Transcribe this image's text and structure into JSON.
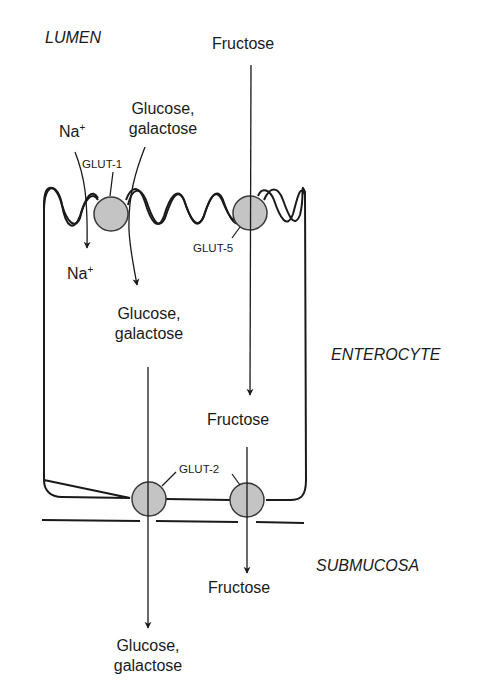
{
  "regions": {
    "lumen": "LUMEN",
    "enterocyte": "ENTEROCYTE",
    "submucosa": "SUBMUCOSA"
  },
  "substrates": {
    "fructose_lumen": "Fructose",
    "fructose_cell": "Fructose",
    "fructose_submucosa": "Fructose",
    "na_lumen": "Na",
    "na_cell": "Na",
    "na_charge": "+",
    "glucose_lumen_line1": "Glucose,",
    "glucose_lumen_line2": "galactose",
    "glucose_cell_line1": "Glucose,",
    "glucose_cell_line2": "galactose",
    "glucose_submucosa_line1": "Glucose,",
    "glucose_submucosa_line2": "galactose"
  },
  "transporters": {
    "glut1": "GLUT-1",
    "glut5": "GLUT-5",
    "glut2": "GLUT-2"
  },
  "colors": {
    "line": "#1a1a1a",
    "transporter_fill": "#c4c4c4",
    "transporter_stroke": "#3a3a3a",
    "background": "#ffffff"
  }
}
